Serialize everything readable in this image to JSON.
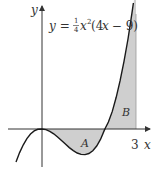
{
  "diagram": {
    "equation": {
      "lhs": "y",
      "eq": " = ",
      "frac_num": "1",
      "frac_den": "4",
      "rest_x": "x",
      "rest_exp": "2",
      "rest_paren": "(4",
      "rest_x2": "x",
      "rest_tail": " − 9)"
    },
    "axis_labels": {
      "x": "x",
      "y": "y"
    },
    "tick_labels": {
      "x3": "3"
    },
    "region_labels": {
      "A": "A",
      "B": "B"
    },
    "colors": {
      "curve": "#1a1a1a",
      "shade": "#cfcfcf",
      "axis": "#333333"
    }
  }
}
